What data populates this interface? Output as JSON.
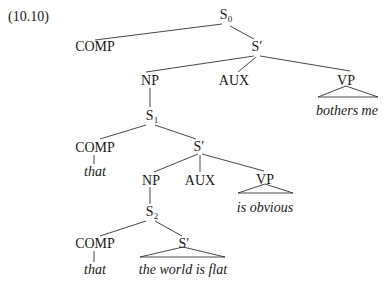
{
  "example_number": "(10.10)",
  "nodes": {
    "s0": {
      "cat": "S",
      "sub": "0"
    },
    "comp_top": {
      "cat": "COMP"
    },
    "sbar_top": {
      "cat": "S′"
    },
    "np_top": {
      "cat": "NP"
    },
    "aux_top": {
      "cat": "AUX"
    },
    "vp_top": {
      "cat": "VP"
    },
    "vp_top_text": "bothers me",
    "s1": {
      "cat": "S",
      "sub": "1"
    },
    "comp_mid": {
      "cat": "COMP"
    },
    "comp_mid_text": "that",
    "sbar_mid": {
      "cat": "S′"
    },
    "np_mid": {
      "cat": "NP"
    },
    "aux_mid": {
      "cat": "AUX"
    },
    "vp_mid": {
      "cat": "VP"
    },
    "vp_mid_text": "is obvious",
    "s2": {
      "cat": "S",
      "sub": "2"
    },
    "comp_low": {
      "cat": "COMP"
    },
    "comp_low_text": "that",
    "sbar_low": {
      "cat": "S′"
    },
    "sbar_low_text": "the world is flat"
  },
  "colors": {
    "line": "#333333",
    "text": "#1a1a1a",
    "background": "#ffffff"
  }
}
